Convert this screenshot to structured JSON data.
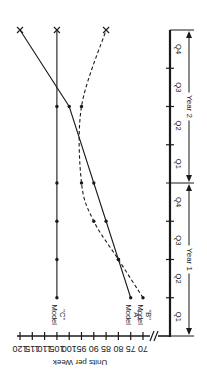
{
  "chart_data": {
    "type": "line",
    "orientation": "rotated-90-clockwise",
    "title": "",
    "xlabel": "",
    "ylabel": "Units per Week",
    "ylim": [
      70,
      120
    ],
    "y_ticks": [
      120,
      115,
      110,
      105,
      100,
      95,
      90,
      85,
      80,
      75,
      70
    ],
    "y_axis_break": true,
    "grid": false,
    "x_periods": [
      {
        "label": "Year 1",
        "quarters": [
          "Q1",
          "Q2",
          "Q3",
          "Q4"
        ]
      },
      {
        "label": "Year 2",
        "quarters": [
          "Q1",
          "Q2",
          "Q3",
          "Q4"
        ]
      }
    ],
    "x_tick_labels": [
      "Q1",
      "Q2",
      "Q3",
      "Q4",
      "Q1",
      "Q2",
      "Q3",
      "Q4"
    ],
    "x": [
      "Y1 Q1 end",
      "Y1 Q2 end",
      "Y1 Q3 end",
      "Y1 Q4 end",
      "Y2 Q2 end",
      "Y2 Q4 end"
    ],
    "x_index": [
      1,
      2,
      3,
      4,
      6,
      8
    ],
    "series": [
      {
        "name": "Model \"A\"",
        "label_line1": "Model",
        "label_line2": "\"A\"",
        "style": "solid",
        "values": [
          75,
          80,
          85,
          90,
          100,
          120
        ]
      },
      {
        "name": "Model \"B\"",
        "label_line1": "Model",
        "label_line2": "\"B\"",
        "style": "dashed",
        "values": [
          70,
          80,
          90,
          95,
          95,
          85
        ]
      },
      {
        "name": "Model \"C\"",
        "label_line1": "Model",
        "label_line2": "\"C\"",
        "style": "solid",
        "values": [
          105,
          105,
          105,
          105,
          105,
          105
        ]
      }
    ],
    "end_marker": "x",
    "point_marker": "dot"
  }
}
